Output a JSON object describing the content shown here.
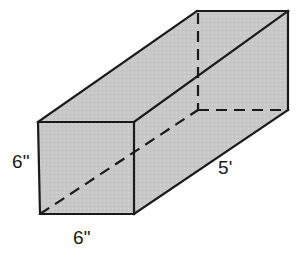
{
  "figure": {
    "name": "rectangular-prism",
    "type": "geometry-diagram",
    "projection": "oblique",
    "background_color": "#ffffff",
    "face_fill_color": "#c8c8c8",
    "edge_color": "#1a1a1a",
    "label_color": "#1a1a1a"
  },
  "labels": {
    "height": "6\"",
    "width": "6\"",
    "length": "5'"
  },
  "dimensions": {
    "height_value": 6,
    "height_unit": "inches",
    "width_value": 6,
    "width_unit": "inches",
    "length_value": 5,
    "length_unit": "feet"
  },
  "geometry": {
    "front_face": [
      [
        38,
        122
      ],
      [
        134,
        122
      ],
      [
        134,
        214
      ],
      [
        40,
        214
      ]
    ],
    "back_face": [
      [
        197,
        11
      ],
      [
        288,
        11
      ],
      [
        288,
        110
      ],
      [
        198,
        110
      ]
    ],
    "top_face": [
      [
        38,
        122
      ],
      [
        197,
        11
      ],
      [
        288,
        11
      ],
      [
        134,
        122
      ]
    ],
    "right_face": [
      [
        134,
        122
      ],
      [
        288,
        11
      ],
      [
        288,
        110
      ],
      [
        134,
        214
      ]
    ],
    "hidden_edges": [
      {
        "name": "back-left-vertical",
        "from": [
          198,
          11
        ],
        "to": [
          198,
          110
        ]
      },
      {
        "name": "back-bottom-horizontal",
        "from": [
          198,
          110
        ],
        "to": [
          288,
          110
        ]
      },
      {
        "name": "bottom-left-diagonal",
        "from": [
          40,
          214
        ],
        "to": [
          198,
          110
        ]
      }
    ]
  }
}
